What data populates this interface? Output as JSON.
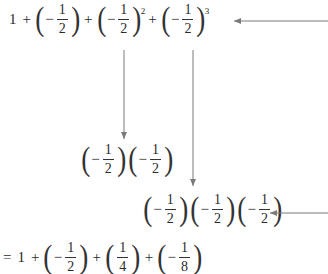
{
  "diagram": {
    "top_expression": {
      "terms": [
        {
          "type": "number",
          "value": "1"
        },
        {
          "type": "op",
          "value": "+"
        },
        {
          "type": "frac",
          "sign": "−",
          "num": "1",
          "den": "2",
          "exponent": ""
        },
        {
          "type": "op",
          "value": "+"
        },
        {
          "type": "frac",
          "sign": "−",
          "num": "1",
          "den": "2",
          "exponent": "2"
        },
        {
          "type": "op",
          "value": "+"
        },
        {
          "type": "frac",
          "sign": "−",
          "num": "1",
          "den": "2",
          "exponent": "3"
        }
      ]
    },
    "square_expansion": {
      "sign": "−",
      "num": "1",
      "den": "2",
      "count": 2
    },
    "cube_expansion": {
      "sign": "−",
      "num": "1",
      "den": "2",
      "count": 3
    },
    "result_expression": {
      "equals": "=",
      "terms": [
        {
          "type": "number",
          "value": "1"
        },
        {
          "type": "op",
          "value": "+"
        },
        {
          "type": "frac",
          "sign": "−",
          "num": "1",
          "den": "2"
        },
        {
          "type": "op",
          "value": "+"
        },
        {
          "type": "frac",
          "sign": "",
          "num": "1",
          "den": "4"
        },
        {
          "type": "op",
          "value": "+"
        },
        {
          "type": "frac",
          "sign": "−",
          "num": "1",
          "den": "8"
        }
      ]
    },
    "arrow_color": "#7a7a7a"
  }
}
